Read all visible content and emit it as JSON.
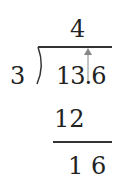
{
  "division": {
    "divisor": "3",
    "dividend": "13.6",
    "quotient": "4",
    "step1_product": "12",
    "step1_remainder": "1 6"
  },
  "annotations": {
    "arrow": "decimal-point-up-arrow"
  },
  "colors": {
    "text": "#222222",
    "arrow": "#888888"
  }
}
